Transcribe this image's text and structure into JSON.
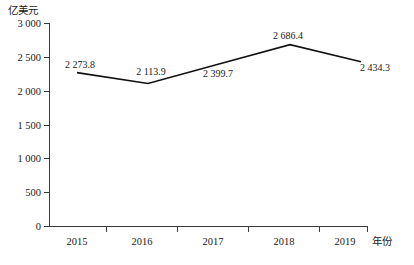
{
  "chart_data": {
    "type": "line",
    "title": "",
    "subtitle": "",
    "xlabel": "年份",
    "ylabel": "亿美元",
    "categories": [
      "2015",
      "2016",
      "2017",
      "2018",
      "2019"
    ],
    "values": [
      2273.8,
      2113.9,
      2399.7,
      2686.4,
      2434.3
    ],
    "data_labels": [
      "2 273.8",
      "2 113.9",
      "2 399.7",
      "2 686.4",
      "2 434.3"
    ],
    "series": [
      {
        "name": "",
        "values": [
          2273.8,
          2113.9,
          2399.7,
          2686.4,
          2434.3
        ],
        "color": "#111111"
      }
    ],
    "ylim": [
      0,
      3000
    ],
    "ytick_values": [
      0,
      500,
      1000,
      1500,
      2000,
      2500,
      3000
    ],
    "ytick_labels": [
      "0",
      "500",
      "1 000",
      "1 500",
      "2 000",
      "2 500",
      "3 000"
    ],
    "xtick_labels": [
      "2015",
      "2016",
      "2017",
      "2018",
      "2019"
    ],
    "grid": false,
    "legend": false,
    "legend_position": "none",
    "axis_color": "#3a3a3a",
    "text_color": "#1a1a1a",
    "background_color": "#ffffff",
    "label_positions": [
      "above-left",
      "above",
      "below",
      "above",
      "below"
    ]
  }
}
